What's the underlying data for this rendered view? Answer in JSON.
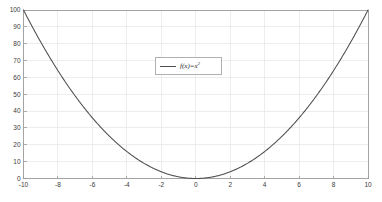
{
  "chart_data": {
    "type": "line",
    "title": "",
    "xlabel": "",
    "ylabel": "",
    "xlim": [
      -10,
      10
    ],
    "ylim": [
      0,
      100
    ],
    "grid": true,
    "legend_position": "upper-center",
    "x_ticks": [
      -10,
      -8,
      -6,
      -4,
      -2,
      0,
      2,
      4,
      6,
      8,
      10
    ],
    "x_tick_labels": [
      "-10",
      "-8",
      "-6",
      "-4",
      "-2",
      "0",
      "2",
      "4",
      "6",
      "8",
      "10"
    ],
    "y_ticks": [
      0,
      10,
      20,
      30,
      40,
      50,
      60,
      70,
      80,
      90,
      100
    ],
    "y_tick_labels": [
      "0",
      "10",
      "20",
      "30",
      "40",
      "50",
      "60",
      "70",
      "80",
      "90",
      "100"
    ],
    "series": [
      {
        "name": "f(x)=x",
        "name_superscript": "2",
        "expression": "f(x)=x^2",
        "color": "#4d4d4d",
        "x": [
          -10,
          -9.5,
          -9,
          -8.5,
          -8,
          -7.5,
          -7,
          -6.5,
          -6,
          -5.5,
          -5,
          -4.5,
          -4,
          -3.5,
          -3,
          -2.5,
          -2,
          -1.5,
          -1,
          -0.5,
          0,
          0.5,
          1,
          1.5,
          2,
          2.5,
          3,
          3.5,
          4,
          4.5,
          5,
          5.5,
          6,
          6.5,
          7,
          7.5,
          8,
          8.5,
          9,
          9.5,
          10
        ],
        "values": [
          100,
          90.25,
          81,
          72.25,
          64,
          56.25,
          49,
          42.25,
          36,
          30.25,
          25,
          20.25,
          16,
          12.25,
          9,
          6.25,
          4,
          2.25,
          1,
          0.25,
          0,
          0.25,
          1,
          2.25,
          4,
          6.25,
          9,
          12.25,
          16,
          20.25,
          25,
          30.25,
          36,
          42.25,
          49,
          56.25,
          64,
          72.25,
          81,
          90.25,
          100
        ]
      }
    ],
    "colors": {
      "background": "#ffffff",
      "grid": "#e6e6e6",
      "axis": "#9a9a9a",
      "curve": "#4d4d4d",
      "tick_text": "#3a3a3a",
      "legend_border": "#b0b0b0"
    }
  }
}
